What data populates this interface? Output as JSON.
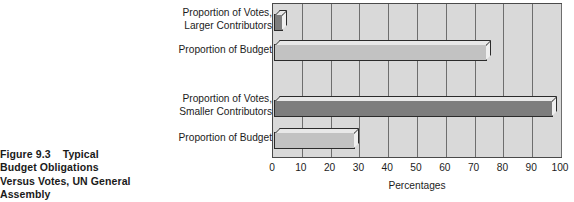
{
  "figure": {
    "caption_lines": [
      "Figure 9.3    Typical",
      "Budget Obligations",
      "Versus Votes, UN General",
      "Assembly"
    ]
  },
  "chart_data": {
    "type": "bar",
    "orientation": "horizontal",
    "title": "Figure 9.3  Typical Budget Obligations Versus Votes, UN General Assembly",
    "xlabel": "Percentages",
    "ylabel": "",
    "xlim": [
      0,
      100
    ],
    "xticks": [
      0,
      10,
      20,
      30,
      40,
      50,
      60,
      70,
      80,
      90,
      100
    ],
    "xtick_labels": [
      "0",
      "10",
      "20",
      "30",
      "40",
      "50",
      "60",
      "70",
      "80",
      "90",
      "100"
    ],
    "grid": true,
    "legend": "none",
    "categories": [
      "Proportion of Votes, Larger Contributors",
      "Proportion of Budget",
      "Proportion of Votes, Smaller Contributors",
      "Proportion of Budget"
    ],
    "category_label_lines": [
      [
        "Proportion of Votes,",
        "Larger Contributors"
      ],
      [
        "Proportion of Budget"
      ],
      [
        "Proportion of Votes,",
        "Smaller Contributors"
      ],
      [
        "Proportion of Budget"
      ]
    ],
    "values": [
      3,
      74,
      97,
      28
    ],
    "bar_colors": [
      "#7d7d7d",
      "#c2c2c2",
      "#7d7d7d",
      "#c2c2c2"
    ],
    "plot_background": "#d9d9d9"
  }
}
